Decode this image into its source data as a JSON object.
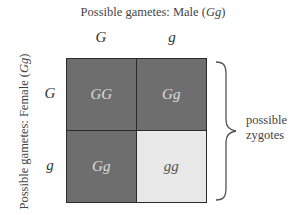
{
  "title": {
    "prefix": "Possible gametes: Male (",
    "genotype": "Gg",
    "suffix": ")"
  },
  "side_title": {
    "prefix": "Possible gametes: Female (",
    "genotype": "Gg",
    "suffix": ")"
  },
  "columns": [
    "G",
    "g"
  ],
  "rows": [
    "G",
    "g"
  ],
  "cells": [
    {
      "label": "GG",
      "shade": "dark"
    },
    {
      "label": "Gg",
      "shade": "dark"
    },
    {
      "label": "Gg",
      "shade": "dark"
    },
    {
      "label": "gg",
      "shade": "light"
    }
  ],
  "brace_label": {
    "line1": "possible",
    "line2": "zygotes"
  },
  "colors": {
    "dominant": "#6e6e6e",
    "recessive": "#e8e8e8",
    "border": "#2a2a2a"
  }
}
